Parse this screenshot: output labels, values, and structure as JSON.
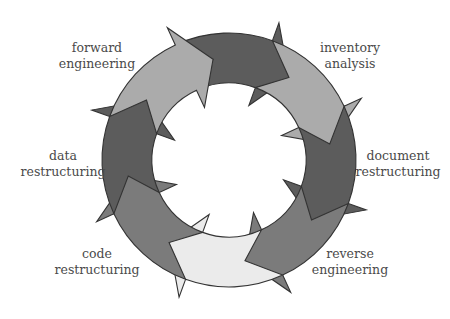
{
  "diagram": {
    "center": [
      229,
      160
    ],
    "outer_radius": 127,
    "inner_radius": 77,
    "barb_outer_radius": 146,
    "barb_inner_radius": 58,
    "tip_radius": 102,
    "tip_offset_deg": 16,
    "outline_color": "#333333",
    "arrows": [
      {
        "id": "top",
        "base_deg": 20,
        "color": "#5c5c5c"
      },
      {
        "id": "upper-right",
        "base_deg": 65,
        "color": "#ababab"
      },
      {
        "id": "right",
        "base_deg": 110,
        "color": "#5c5c5c"
      },
      {
        "id": "lower-right",
        "base_deg": 155,
        "color": "#7b7b7b"
      },
      {
        "id": "bottom",
        "base_deg": 200,
        "color": "#ebebeb"
      },
      {
        "id": "lower-left",
        "base_deg": 245,
        "color": "#7b7b7b"
      },
      {
        "id": "left",
        "base_deg": 290,
        "color": "#5c5c5c"
      },
      {
        "id": "upper-left",
        "base_deg": 335,
        "color": "#ababab"
      }
    ],
    "direction": "clockwise"
  },
  "labels": [
    {
      "id": "forward-engineering",
      "line1": "forward",
      "line2": "engineering",
      "x": 97,
      "y": 40
    },
    {
      "id": "inventory-analysis",
      "line1": "inventory",
      "line2": "analysis",
      "x": 350,
      "y": 40
    },
    {
      "id": "document-restructuring",
      "line1": "document",
      "line2": "restructuring",
      "x": 398,
      "y": 148
    },
    {
      "id": "reverse-engineering",
      "line1": "reverse",
      "line2": "engineering",
      "x": 350,
      "y": 246
    },
    {
      "id": "code-restructuring",
      "line1": "code",
      "line2": "restructuring",
      "x": 97,
      "y": 246
    },
    {
      "id": "data-restructuring",
      "line1": "data",
      "line2": "restructuring",
      "x": 63,
      "y": 148
    }
  ]
}
